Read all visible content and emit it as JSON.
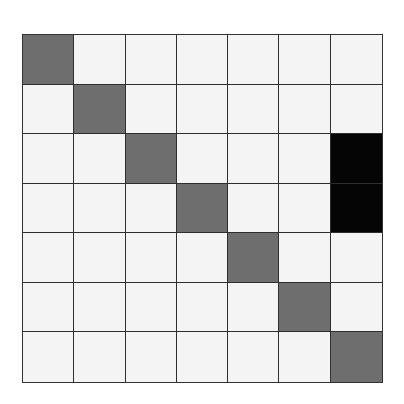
{
  "diagram": {
    "type": "grid",
    "rows": 7,
    "cols": 7,
    "colors": {
      "empty": "#f4f4f4",
      "gray": "#6e6e6e",
      "black": "#050505",
      "line": "#2e2e2e"
    },
    "cells": [
      [
        "gray",
        "empty",
        "empty",
        "empty",
        "empty",
        "empty",
        "empty"
      ],
      [
        "empty",
        "gray",
        "empty",
        "empty",
        "empty",
        "empty",
        "empty"
      ],
      [
        "empty",
        "empty",
        "gray",
        "empty",
        "empty",
        "empty",
        "black"
      ],
      [
        "empty",
        "empty",
        "empty",
        "gray",
        "empty",
        "empty",
        "black"
      ],
      [
        "empty",
        "empty",
        "empty",
        "empty",
        "gray",
        "empty",
        "empty"
      ],
      [
        "empty",
        "empty",
        "empty",
        "empty",
        "empty",
        "gray",
        "empty"
      ],
      [
        "empty",
        "empty",
        "empty",
        "empty",
        "empty",
        "empty",
        "gray"
      ]
    ]
  }
}
